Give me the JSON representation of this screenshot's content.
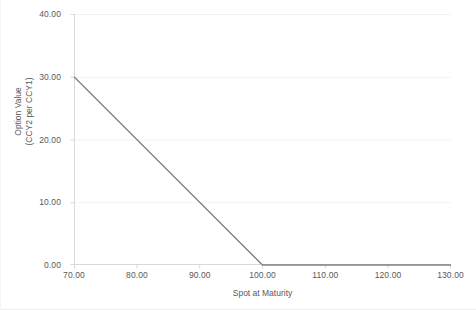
{
  "chart_data": {
    "type": "line",
    "title": "",
    "subtitle": "",
    "xlabel": "Spot at Maturity",
    "ylabel": "Option Value\n(CCY2 per CCY1)",
    "ylabel_lines": [
      "Option Value",
      "(CCY2 per CCY1)"
    ],
    "xlim": [
      70,
      130
    ],
    "ylim": [
      0,
      40
    ],
    "xticks": [
      70,
      80,
      90,
      100,
      110,
      120,
      130
    ],
    "yticks": [
      0,
      10,
      20,
      30,
      40
    ],
    "xtick_labels": [
      "70.00",
      "80.00",
      "90.00",
      "100.00",
      "110.00",
      "120.00",
      "130.00"
    ],
    "ytick_labels": [
      "0.00",
      "10.00",
      "20.00",
      "30.00",
      "40.00"
    ],
    "grid": "horizontal",
    "legend": "none",
    "series": [
      {
        "name": "Option Value",
        "color": "#808080",
        "x": [
          70,
          80,
          90,
          100,
          110,
          120,
          130
        ],
        "values": [
          30,
          20,
          10,
          0,
          0,
          0,
          0
        ]
      }
    ],
    "annotations": []
  },
  "colors": {
    "line": "#808080",
    "gridline": "#f2f2f2",
    "axis": "#d9d9d9",
    "text": "#595959",
    "background": "#ffffff"
  },
  "axes": {
    "y_title_line1": "Option Value",
    "y_title_line2": "(CCY2 per CCY1)",
    "x_title": "Spot at Maturity"
  }
}
